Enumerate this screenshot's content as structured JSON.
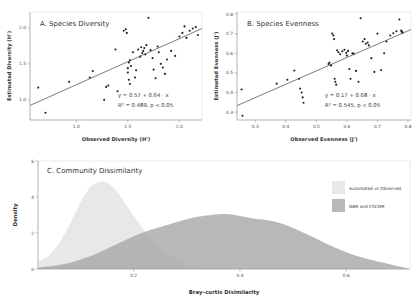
{
  "figure": {
    "background": "#ffffff",
    "point_color": "#1f1f1f",
    "line_color": "#333333"
  },
  "chart_data": [
    {
      "type": "scatter",
      "panel": "A",
      "title": "A. Species Diversity",
      "xlabel": "Observed Diversity (H')",
      "ylabel": "Estimated Diversity (H')",
      "xlim": [
        0.55,
        2.22
      ],
      "ylim": [
        0.72,
        2.22
      ],
      "xticks": [
        1.0,
        1.5,
        2.0
      ],
      "xticklabels": [
        "1.0",
        "1.5",
        "2.0"
      ],
      "yticks": [
        1.0,
        1.5,
        2.0
      ],
      "yticklabels": [
        "1.0",
        "1.5",
        "2.0"
      ],
      "grid": false,
      "annotation_eq": "y = 0.57 + 0.64 · x",
      "annotation_stats": "R² = 0.489, p < 0.05",
      "fit": {
        "intercept": 0.57,
        "slope": 0.64,
        "r2": 0.489,
        "p": "< 0.05"
      },
      "x": [
        0.63,
        0.7,
        0.93,
        1.13,
        1.16,
        1.27,
        1.29,
        1.31,
        1.38,
        1.4,
        1.46,
        1.48,
        1.49,
        1.5,
        1.5,
        1.51,
        1.51,
        1.52,
        1.52,
        1.53,
        1.55,
        1.57,
        1.58,
        1.6,
        1.62,
        1.63,
        1.64,
        1.65,
        1.66,
        1.67,
        1.68,
        1.7,
        1.72,
        1.74,
        1.75,
        1.77,
        1.79,
        1.8,
        1.82,
        1.84,
        1.86,
        1.88,
        1.92,
        1.96,
        2.0,
        2.03,
        2.05,
        2.07,
        2.1,
        2.13,
        2.16,
        2.18
      ],
      "y": [
        1.17,
        0.82,
        1.25,
        1.31,
        1.4,
        1.0,
        1.18,
        1.2,
        1.7,
        1.12,
        1.96,
        1.98,
        1.93,
        1.44,
        1.38,
        1.52,
        1.28,
        1.55,
        1.22,
        1.47,
        1.66,
        1.31,
        1.41,
        1.7,
        1.6,
        1.73,
        1.65,
        1.68,
        1.72,
        1.63,
        1.76,
        2.14,
        1.69,
        1.58,
        1.42,
        1.3,
        1.74,
        1.66,
        1.5,
        1.45,
        1.36,
        1.56,
        1.68,
        1.61,
        1.88,
        1.93,
        2.02,
        1.86,
        1.96,
        1.99,
        2.01,
        1.9
      ]
    },
    {
      "type": "scatter",
      "panel": "B",
      "title": "B. Species Evenness",
      "xlabel": "Observed Evenness (J')",
      "ylabel": "Estimated Evenness (J')",
      "xlim": [
        0.24,
        0.81
      ],
      "ylim": [
        0.26,
        0.81
      ],
      "xticks": [
        0.3,
        0.4,
        0.5,
        0.6,
        0.7,
        0.8
      ],
      "xticklabels": [
        "0.3",
        "0.4",
        "0.5",
        "0.6",
        "0.7",
        "0.8"
      ],
      "yticks": [
        0.3,
        0.4,
        0.5,
        0.6,
        0.7,
        0.8
      ],
      "yticklabels": [
        "0.3",
        "0.4",
        "0.5",
        "0.6",
        "0.7",
        "0.8"
      ],
      "grid": false,
      "annotation_eq": "y = 0.17 + 0.68 · x",
      "annotation_stats": "R² = 0.545, p < 0.05",
      "fit": {
        "intercept": 0.17,
        "slope": 0.68,
        "r2": 0.545,
        "p": "< 0.05"
      },
      "x": [
        0.255,
        0.258,
        0.37,
        0.405,
        0.428,
        0.443,
        0.447,
        0.452,
        0.455,
        0.458,
        0.54,
        0.543,
        0.548,
        0.552,
        0.556,
        0.558,
        0.56,
        0.562,
        0.565,
        0.568,
        0.572,
        0.578,
        0.585,
        0.592,
        0.598,
        0.6,
        0.604,
        0.608,
        0.612,
        0.618,
        0.622,
        0.63,
        0.638,
        0.645,
        0.652,
        0.658,
        0.662,
        0.668,
        0.672,
        0.68,
        0.69,
        0.7,
        0.712,
        0.722,
        0.73,
        0.742,
        0.752,
        0.762,
        0.772,
        0.778,
        0.78,
        0.782
      ],
      "y": [
        0.415,
        0.282,
        0.445,
        0.465,
        0.512,
        0.47,
        0.42,
        0.4,
        0.375,
        0.348,
        0.545,
        0.552,
        0.538,
        0.7,
        0.69,
        0.672,
        0.47,
        0.455,
        0.44,
        0.615,
        0.605,
        0.595,
        0.61,
        0.618,
        0.602,
        0.588,
        0.612,
        0.52,
        0.47,
        0.6,
        0.598,
        0.51,
        0.455,
        0.778,
        0.66,
        0.672,
        0.648,
        0.655,
        0.64,
        0.575,
        0.505,
        0.7,
        0.515,
        0.6,
        0.66,
        0.69,
        0.702,
        0.712,
        0.772,
        0.715,
        0.71,
        0.705
      ]
    },
    {
      "type": "area",
      "panel": "C",
      "title": "C. Community Dissimilarity",
      "xlabel": "Bray–curtis Disimilarity",
      "ylabel": "Density",
      "xlim": [
        0.02,
        0.72
      ],
      "ylim": [
        0,
        6
      ],
      "xticks": [
        0.2,
        0.4,
        0.6
      ],
      "xticklabels": [
        "0.2",
        "0.4",
        "0.6"
      ],
      "yticks": [
        0,
        2,
        4,
        6
      ],
      "yticklabels": [
        "0",
        "2",
        "4",
        "6"
      ],
      "grid": false,
      "legend_position": "top-right",
      "series": [
        {
          "name": "Automated vs Observed",
          "color": "#e8e8e8",
          "x": [
            0.02,
            0.04,
            0.06,
            0.08,
            0.1,
            0.12,
            0.14,
            0.155,
            0.17,
            0.185,
            0.2,
            0.215,
            0.23,
            0.245,
            0.26,
            0.275,
            0.29,
            0.31,
            0.33,
            0.36
          ],
          "values": [
            0.4,
            0.75,
            1.45,
            2.5,
            3.7,
            4.6,
            4.85,
            4.7,
            4.25,
            3.6,
            2.95,
            2.35,
            1.8,
            1.3,
            0.9,
            0.58,
            0.35,
            0.18,
            0.08,
            0.02
          ]
        },
        {
          "name": "GBR and CSCMR",
          "color": "#a8a8a8",
          "x": [
            0.02,
            0.05,
            0.08,
            0.11,
            0.14,
            0.17,
            0.2,
            0.23,
            0.26,
            0.29,
            0.32,
            0.35,
            0.375,
            0.4,
            0.425,
            0.45,
            0.475,
            0.5,
            0.53,
            0.56,
            0.59,
            0.62,
            0.65,
            0.68,
            0.7,
            0.715
          ],
          "values": [
            0.08,
            0.18,
            0.35,
            0.62,
            0.98,
            1.4,
            1.82,
            2.15,
            2.42,
            2.68,
            2.9,
            3.02,
            3.05,
            2.95,
            2.8,
            2.72,
            2.55,
            2.28,
            1.88,
            1.45,
            1.05,
            0.72,
            0.48,
            0.28,
            0.14,
            0.05
          ]
        }
      ]
    }
  ]
}
